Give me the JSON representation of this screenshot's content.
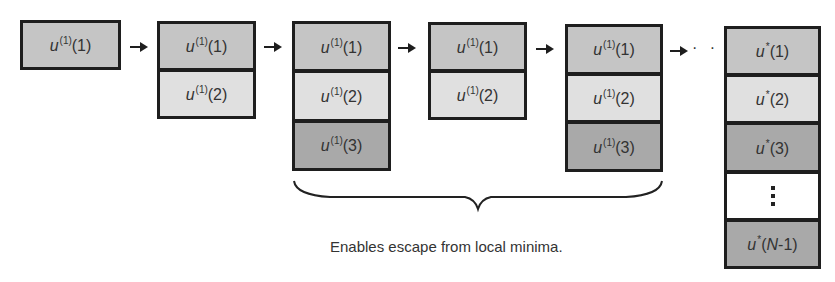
{
  "diagram": {
    "stacks": [
      {
        "cells": [
          {
            "base": "u",
            "sup": "(1)",
            "arg": "(1)",
            "shade": "c1"
          }
        ]
      },
      {
        "cells": [
          {
            "base": "u",
            "sup": "(1)",
            "arg": "(1)",
            "shade": "c1"
          },
          {
            "base": "u",
            "sup": "(1)",
            "arg": "(2)",
            "shade": "c2"
          }
        ]
      },
      {
        "cells": [
          {
            "base": "u",
            "sup": "(1)",
            "arg": "(1)",
            "shade": "c1"
          },
          {
            "base": "u",
            "sup": "(1)",
            "arg": "(2)",
            "shade": "c2"
          },
          {
            "base": "u",
            "sup": "(1)",
            "arg": "(3)",
            "shade": "c3"
          }
        ]
      },
      {
        "cells": [
          {
            "base": "u",
            "sup": "(1)",
            "arg": "(1)",
            "shade": "c1"
          },
          {
            "base": "u",
            "sup": "(1)",
            "arg": "(2)",
            "shade": "c2"
          }
        ]
      },
      {
        "cells": [
          {
            "base": "u",
            "sup": "(1)",
            "arg": "(1)",
            "shade": "c1"
          },
          {
            "base": "u",
            "sup": "(1)",
            "arg": "(2)",
            "shade": "c2"
          },
          {
            "base": "u",
            "sup": "(1)",
            "arg": "(3)",
            "shade": "c3"
          }
        ]
      },
      {
        "cells": [
          {
            "base": "u",
            "sup": "*",
            "arg": "(1)",
            "shade": "c1"
          },
          {
            "base": "u",
            "sup": "*",
            "arg": "(2)",
            "shade": "c2"
          },
          {
            "base": "u",
            "sup": "*",
            "arg": "(3)",
            "shade": "c3"
          },
          {
            "ellipsis": true,
            "shade": "cw"
          },
          {
            "base": "u",
            "sup": "*",
            "arg": "(N-1)",
            "shade": "c3"
          }
        ]
      }
    ],
    "continuation": "· · ·",
    "brace_caption": "Enables escape from local minima.",
    "colors": {
      "border": "#1e1e1e",
      "shade1": "#c5c5c5",
      "shade2": "#e0e0e0",
      "shade3": "#a9a9a9"
    }
  }
}
